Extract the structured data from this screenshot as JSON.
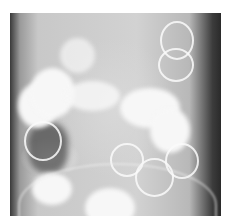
{
  "caption": {
    "text": "",
    "note": "partially cropped caption line at top edge (illegible)"
  },
  "image": {
    "subject": "abdominal X-ray radiograph (contrast-filled colon)",
    "tone": "grayscale"
  }
}
